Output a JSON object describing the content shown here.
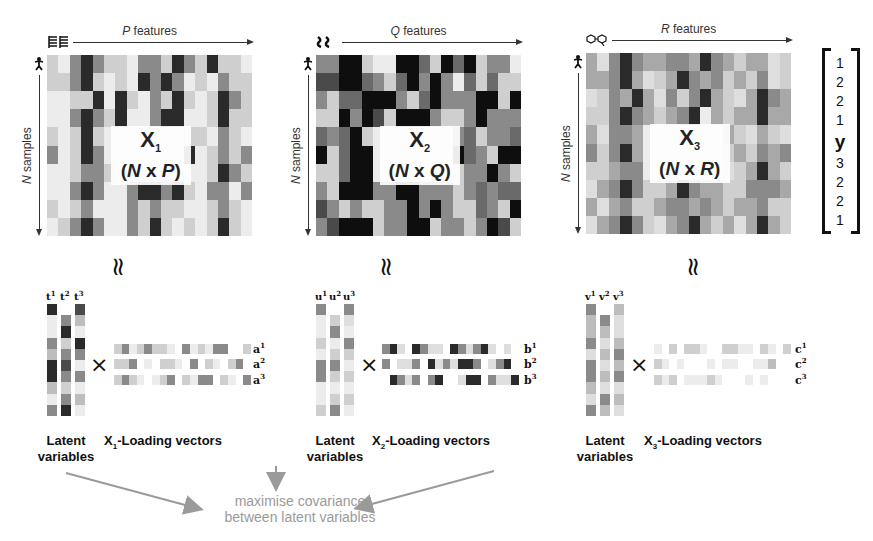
{
  "matrices": [
    {
      "id": "X1",
      "features_var": "P",
      "features_text": " features",
      "samples_var": "N",
      "samples_text": " samples",
      "name": "X",
      "subscript": "1",
      "dims_prefix": "(",
      "dims_rows": "N",
      "dims_x": " x ",
      "dims_cols": "P",
      "dims_suffix": ")",
      "feature_icon": "bar-chart-icon",
      "grid": [
        [
          3,
          1,
          6,
          9,
          6,
          3,
          3,
          1,
          6,
          6,
          3,
          9,
          6,
          3,
          9,
          3,
          3,
          1
        ],
        [
          3,
          3,
          6,
          9,
          3,
          1,
          3,
          1,
          9,
          6,
          9,
          6,
          1,
          3,
          1,
          6,
          3,
          3
        ],
        [
          1,
          1,
          3,
          3,
          9,
          1,
          9,
          3,
          1,
          6,
          3,
          9,
          3,
          1,
          3,
          9,
          6,
          3
        ],
        [
          1,
          1,
          6,
          9,
          6,
          3,
          9,
          1,
          1,
          6,
          9,
          9,
          1,
          1,
          3,
          9,
          3,
          3
        ],
        [
          3,
          1,
          3,
          9,
          3,
          1,
          1,
          1,
          1,
          1,
          1,
          1,
          3,
          3,
          1,
          6,
          3,
          1
        ],
        [
          6,
          1,
          3,
          9,
          6,
          1,
          1,
          1,
          1,
          1,
          1,
          1,
          9,
          1,
          3,
          6,
          3,
          6
        ],
        [
          1,
          1,
          3,
          6,
          6,
          3,
          1,
          1,
          3,
          3,
          3,
          1,
          1,
          1,
          3,
          9,
          6,
          3
        ],
        [
          1,
          1,
          6,
          9,
          6,
          1,
          1,
          6,
          9,
          9,
          6,
          9,
          3,
          1,
          6,
          6,
          1,
          6
        ],
        [
          3,
          1,
          3,
          6,
          1,
          1,
          1,
          6,
          3,
          6,
          3,
          3,
          1,
          1,
          3,
          6,
          3,
          1
        ],
        [
          1,
          3,
          6,
          9,
          6,
          1,
          1,
          6,
          3,
          9,
          3,
          1,
          3,
          1,
          3,
          9,
          3,
          1
        ]
      ]
    },
    {
      "id": "X2",
      "features_var": "Q",
      "features_text": " features",
      "samples_var": "N",
      "samples_text": " samples",
      "name": "X",
      "subscript": "2",
      "dims_prefix": "(",
      "dims_rows": "N",
      "dims_x": " x ",
      "dims_cols": "Q",
      "dims_suffix": ")",
      "feature_icon": "molecule-chain-icon",
      "grid": [
        [
          6,
          6,
          10,
          10,
          3,
          1,
          1,
          10,
          10,
          7,
          3,
          10,
          7,
          10,
          3,
          6,
          6,
          1
        ],
        [
          8,
          8,
          10,
          10,
          7,
          6,
          3,
          7,
          10,
          6,
          10,
          6,
          1,
          7,
          3,
          7,
          3,
          3
        ],
        [
          6,
          3,
          7,
          7,
          10,
          10,
          10,
          6,
          3,
          7,
          10,
          6,
          6,
          6,
          10,
          10,
          3,
          10
        ],
        [
          3,
          3,
          10,
          6,
          10,
          8,
          3,
          10,
          10,
          10,
          6,
          3,
          3,
          6,
          10,
          6,
          6,
          6
        ],
        [
          7,
          6,
          7,
          10,
          3,
          1,
          1,
          1,
          1,
          1,
          1,
          1,
          6,
          7,
          3,
          6,
          6,
          7
        ],
        [
          10,
          3,
          7,
          10,
          10,
          1,
          1,
          1,
          1,
          1,
          1,
          1,
          10,
          7,
          6,
          3,
          10,
          10
        ],
        [
          3,
          3,
          7,
          10,
          10,
          1,
          1,
          1,
          1,
          1,
          1,
          1,
          3,
          6,
          6,
          10,
          6,
          3
        ],
        [
          6,
          3,
          10,
          10,
          10,
          6,
          6,
          10,
          10,
          6,
          6,
          6,
          3,
          6,
          7,
          6,
          7,
          7
        ],
        [
          8,
          6,
          3,
          6,
          3,
          3,
          6,
          6,
          10,
          6,
          10,
          6,
          3,
          3,
          7,
          6,
          3,
          10
        ],
        [
          6,
          8,
          10,
          10,
          10,
          3,
          6,
          6,
          10,
          10,
          3,
          6,
          6,
          3,
          6,
          10,
          8,
          3
        ]
      ]
    },
    {
      "id": "X3",
      "features_var": "R",
      "features_text": " features",
      "samples_var": "N",
      "samples_text": " samples",
      "name": "X",
      "subscript": "3",
      "dims_prefix": "(",
      "dims_rows": "N",
      "dims_x": " x ",
      "dims_cols": "R",
      "dims_suffix": ")",
      "feature_icon": "molecule-icon",
      "grid": [
        [
          5,
          2,
          6,
          9,
          6,
          5,
          5,
          6,
          6,
          5,
          9,
          6,
          5,
          3,
          5,
          5,
          2,
          3
        ],
        [
          5,
          5,
          6,
          9,
          5,
          2,
          3,
          5,
          9,
          6,
          5,
          6,
          3,
          5,
          3,
          6,
          2,
          3
        ],
        [
          2,
          3,
          6,
          5,
          9,
          5,
          2,
          6,
          3,
          6,
          9,
          5,
          3,
          2,
          5,
          9,
          6,
          5
        ],
        [
          3,
          3,
          6,
          9,
          6,
          5,
          3,
          5,
          6,
          9,
          1,
          5,
          3,
          5,
          5,
          9,
          5,
          5
        ],
        [
          5,
          2,
          6,
          6,
          5,
          1,
          1,
          1,
          1,
          1,
          1,
          1,
          5,
          3,
          2,
          5,
          3,
          2
        ],
        [
          6,
          3,
          6,
          9,
          5,
          1,
          1,
          1,
          1,
          1,
          1,
          1,
          3,
          5,
          3,
          6,
          5,
          6
        ],
        [
          3,
          3,
          5,
          6,
          6,
          1,
          1,
          1,
          1,
          1,
          1,
          1,
          2,
          3,
          5,
          9,
          5,
          3
        ],
        [
          2,
          5,
          6,
          9,
          6,
          3,
          3,
          5,
          9,
          6,
          5,
          5,
          3,
          3,
          6,
          6,
          6,
          5
        ],
        [
          5,
          2,
          5,
          6,
          3,
          3,
          5,
          6,
          6,
          5,
          6,
          5,
          3,
          5,
          5,
          6,
          3,
          3
        ],
        [
          2,
          5,
          6,
          9,
          6,
          3,
          2,
          5,
          6,
          9,
          5,
          3,
          5,
          2,
          5,
          9,
          5,
          3
        ]
      ]
    }
  ],
  "y_vector": {
    "label": "y",
    "values_top": [
      "1",
      "2",
      "2",
      "1"
    ],
    "values_bottom": [
      "3",
      "2",
      "2",
      "1"
    ]
  },
  "approx_symbol": "≈",
  "times_symbol": "×",
  "blocks": [
    {
      "latent_caption_1": "Latent",
      "latent_caption_2": "variables",
      "latent_letter": "t",
      "latent_cols": [
        {
          "sup": "1",
          "offset": 0,
          "cells": [
            9,
            1,
            1,
            6,
            4,
            9,
            9,
            4,
            1,
            6
          ]
        },
        {
          "sup": "2",
          "offset": 1,
          "cells": [
            6,
            9,
            3,
            6,
            8,
            6,
            3,
            6,
            9
          ]
        },
        {
          "sup": "3",
          "offset": 0,
          "cells": [
            8,
            4,
            1,
            9,
            6,
            1,
            6,
            1,
            4,
            1
          ]
        }
      ],
      "loading_caption_pre": "X",
      "loading_caption_sub": "1",
      "loading_caption_post": "-Loading vectors",
      "loading_letter": "a",
      "loading_rows": [
        {
          "sup": "1",
          "offset": 0,
          "cells": [
            3,
            6,
            1,
            3,
            6,
            3,
            3,
            1,
            0,
            6,
            1,
            3,
            1,
            6,
            6,
            0,
            0,
            3
          ]
        },
        {
          "sup": "2",
          "offset": 0,
          "cells": [
            3,
            3,
            6,
            0,
            1,
            0,
            3,
            3,
            1,
            0,
            6,
            0,
            3,
            1,
            0,
            3,
            6,
            0
          ]
        },
        {
          "sup": "3",
          "offset": 0,
          "cells": [
            3,
            6,
            3,
            1,
            0,
            1,
            3,
            6,
            0,
            3,
            1,
            6,
            6,
            0,
            3,
            1,
            0,
            6
          ]
        }
      ]
    },
    {
      "latent_caption_1": "Latent",
      "latent_caption_2": "variables",
      "latent_letter": "u",
      "latent_cols": [
        {
          "sup": "1",
          "offset": 0,
          "cells": [
            6,
            1,
            1,
            3,
            1,
            6,
            6,
            1,
            1,
            3
          ]
        },
        {
          "sup": "2",
          "offset": 1,
          "cells": [
            3,
            6,
            1,
            3,
            6,
            3,
            1,
            3,
            6
          ]
        },
        {
          "sup": "3",
          "offset": 0,
          "cells": [
            6,
            2,
            1,
            6,
            3,
            1,
            3,
            1,
            3,
            1
          ]
        }
      ],
      "loading_caption_pre": "X",
      "loading_caption_sub": "2",
      "loading_caption_post": "-Loading vectors",
      "loading_letter": "b",
      "loading_rows": [
        {
          "sup": "1",
          "offset": 0,
          "cells": [
            6,
            9,
            2,
            0,
            9,
            6,
            2,
            2,
            0,
            9,
            6,
            2,
            6,
            9,
            2,
            0,
            2,
            0
          ]
        },
        {
          "sup": "2",
          "offset": 0,
          "cells": [
            6,
            0,
            2,
            2,
            6,
            0,
            9,
            2,
            6,
            2,
            9,
            9,
            6,
            0,
            2,
            6,
            9,
            0
          ]
        },
        {
          "sup": "3",
          "offset": 1,
          "cells": [
            9,
            6,
            2,
            6,
            0,
            6,
            9,
            0,
            0,
            2,
            9,
            9,
            0,
            6,
            2,
            2,
            9,
            0
          ]
        }
      ]
    },
    {
      "latent_caption_1": "Latent",
      "latent_caption_2": "variables",
      "latent_letter": "v",
      "latent_cols": [
        {
          "sup": "1",
          "offset": 0,
          "cells": [
            6,
            4,
            4,
            6,
            2,
            6,
            6,
            4,
            2,
            6
          ]
        },
        {
          "sup": "2",
          "offset": 1,
          "cells": [
            6,
            4,
            2,
            4,
            2,
            4,
            2,
            6,
            4
          ]
        },
        {
          "sup": "3",
          "offset": 0,
          "cells": [
            4,
            2,
            2,
            4,
            6,
            4,
            6,
            2,
            4,
            2
          ]
        }
      ],
      "loading_caption_pre": "X",
      "loading_caption_sub": "3",
      "loading_caption_post": "-Loading vectors",
      "loading_letter": "c",
      "loading_rows": [
        {
          "sup": "1",
          "offset": 0,
          "cells": [
            1,
            0,
            3,
            0,
            3,
            3,
            1,
            0,
            0,
            3,
            3,
            1,
            1,
            0,
            3,
            1,
            0,
            3
          ]
        },
        {
          "sup": "2",
          "offset": 0,
          "cells": [
            3,
            1,
            0,
            1,
            0,
            0,
            0,
            1,
            0,
            1,
            1,
            0,
            0,
            1,
            1,
            4,
            0,
            0
          ]
        },
        {
          "sup": "3",
          "offset": 0,
          "cells": [
            3,
            1,
            3,
            0,
            1,
            1,
            1,
            3,
            1,
            0,
            0,
            0,
            1,
            0,
            1,
            0,
            0,
            0
          ]
        }
      ]
    }
  ],
  "covariance": {
    "line1": "maximise covariance",
    "line2": "between latent variables",
    "color": "#9a9a9a"
  },
  "gray_scale": [
    "#ffffff",
    "#ececec",
    "#dedede",
    "#cfcfcf",
    "#bdbdbd",
    "#a8a8a8",
    "#8a8a8a",
    "#6a6a6a",
    "#4a4a4a",
    "#2a2a2a",
    "#0e0e0e"
  ]
}
